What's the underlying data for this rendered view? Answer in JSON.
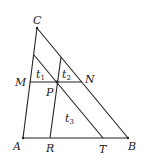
{
  "diagram": {
    "type": "triangle-with-parallel-lines",
    "points": {
      "A": {
        "x": 23,
        "y": 138
      },
      "B": {
        "x": 128,
        "y": 138
      },
      "C": {
        "x": 37,
        "y": 28
      },
      "M": {
        "x": 30,
        "y": 82
      },
      "N": {
        "x": 82,
        "y": 82
      },
      "P": {
        "x": 57,
        "y": 82
      },
      "R": {
        "x": 50,
        "y": 138
      },
      "T": {
        "x": 103,
        "y": 138
      },
      "E": {
        "x": 34,
        "y": 55
      },
      "F": {
        "x": 61,
        "y": 57
      }
    },
    "labels": {
      "A": "A",
      "B": "B",
      "C": "C",
      "M": "M",
      "N": "N",
      "P": "P",
      "R": "R",
      "T": "T"
    },
    "regions": {
      "t1": {
        "base": "t",
        "sub": "1"
      },
      "t2": {
        "base": "t",
        "sub": "2"
      },
      "t3": {
        "base": "t",
        "sub": "3"
      }
    }
  }
}
